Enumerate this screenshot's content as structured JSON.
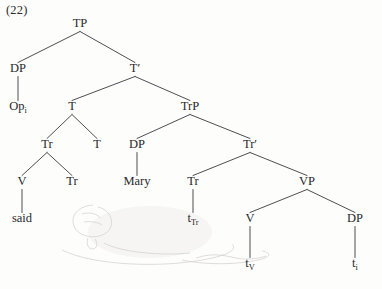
{
  "figure": {
    "example_number": "(22)",
    "type": "syntax-tree",
    "domain": "generative-syntax-phrase-structure-tree"
  },
  "tree": {
    "nodes": [
      {
        "id": "TP",
        "label": "TP",
        "sub": "",
        "x": 80,
        "y": 27
      },
      {
        "id": "DP1",
        "label": "DP",
        "sub": "",
        "x": 18,
        "y": 72
      },
      {
        "id": "Op",
        "label": "Op",
        "sub": "i",
        "x": 18,
        "y": 110
      },
      {
        "id": "Tbar",
        "label": "T′",
        "sub": "",
        "x": 135,
        "y": 72
      },
      {
        "id": "T1",
        "label": "T",
        "sub": "",
        "x": 72,
        "y": 110
      },
      {
        "id": "TrP",
        "label": "TrP",
        "sub": "",
        "x": 190,
        "y": 110
      },
      {
        "id": "Tr1",
        "label": "Tr",
        "sub": "",
        "x": 47,
        "y": 148
      },
      {
        "id": "T2",
        "label": "T",
        "sub": "",
        "x": 97,
        "y": 148
      },
      {
        "id": "DP2",
        "label": "DP",
        "sub": "",
        "x": 137,
        "y": 148
      },
      {
        "id": "Trbar",
        "label": "Tr′",
        "sub": "",
        "x": 250,
        "y": 148
      },
      {
        "id": "V1",
        "label": "V",
        "sub": "",
        "x": 22,
        "y": 185
      },
      {
        "id": "Tr2",
        "label": "Tr",
        "sub": "",
        "x": 72,
        "y": 185
      },
      {
        "id": "Mary",
        "label": "Mary",
        "sub": "",
        "x": 137,
        "y": 185
      },
      {
        "id": "Tr3",
        "label": "Tr",
        "sub": "",
        "x": 193,
        "y": 185
      },
      {
        "id": "VP",
        "label": "VP",
        "sub": "",
        "x": 307,
        "y": 185
      },
      {
        "id": "said",
        "label": "said",
        "sub": "",
        "x": 22,
        "y": 222
      },
      {
        "id": "tTr",
        "label": "t",
        "sub": "Tr",
        "x": 193,
        "y": 222
      },
      {
        "id": "V2",
        "label": "V",
        "sub": "",
        "x": 250,
        "y": 222
      },
      {
        "id": "DP3",
        "label": "DP",
        "sub": "",
        "x": 355,
        "y": 222
      },
      {
        "id": "tV",
        "label": "t",
        "sub": "V",
        "x": 250,
        "y": 267
      },
      {
        "id": "ti",
        "label": "t",
        "sub": "i",
        "x": 355,
        "y": 267
      }
    ],
    "edges": [
      {
        "from": "TP",
        "to": "DP1"
      },
      {
        "from": "TP",
        "to": "Tbar"
      },
      {
        "from": "DP1",
        "to": "Op"
      },
      {
        "from": "Tbar",
        "to": "T1"
      },
      {
        "from": "Tbar",
        "to": "TrP"
      },
      {
        "from": "T1",
        "to": "Tr1"
      },
      {
        "from": "T1",
        "to": "T2"
      },
      {
        "from": "TrP",
        "to": "DP2"
      },
      {
        "from": "TrP",
        "to": "Trbar"
      },
      {
        "from": "Tr1",
        "to": "V1"
      },
      {
        "from": "Tr1",
        "to": "Tr2"
      },
      {
        "from": "DP2",
        "to": "Mary"
      },
      {
        "from": "Trbar",
        "to": "Tr3"
      },
      {
        "from": "Trbar",
        "to": "VP"
      },
      {
        "from": "V1",
        "to": "said"
      },
      {
        "from": "Tr3",
        "to": "tTr"
      },
      {
        "from": "VP",
        "to": "V2"
      },
      {
        "from": "VP",
        "to": "DP3"
      },
      {
        "from": "V2",
        "to": "tV"
      },
      {
        "from": "DP3",
        "to": "ti"
      }
    ]
  },
  "colors": {
    "ink": "#29292b",
    "branch": "#44444a",
    "page": "#fdfdfc",
    "smudge": "#cfcdc9"
  }
}
